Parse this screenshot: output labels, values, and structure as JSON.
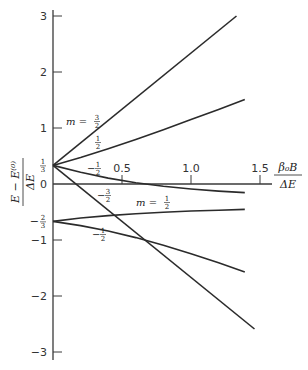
{
  "chart_data": {
    "type": "line",
    "title": "",
    "xlabel": "β₀B / ΔE",
    "ylabel": "(E − E⁽⁰⁾) / ΔE",
    "xlim": [
      0,
      1.6
    ],
    "ylim": [
      -3.2,
      3.1
    ],
    "grid": false,
    "legend": "none (inline annotations)",
    "x_ticks": [
      {
        "value": 0.5,
        "label": "0.5"
      },
      {
        "value": 1.0,
        "label": "1.0"
      },
      {
        "value": 1.5,
        "label": "1.5"
      }
    ],
    "y_ticks": [
      {
        "value": 3,
        "label": "3"
      },
      {
        "value": 2,
        "label": "2"
      },
      {
        "value": 1,
        "label": "1"
      },
      {
        "value": 0,
        "label": "0"
      },
      {
        "value": -1,
        "label": "−1"
      },
      {
        "value": -2,
        "label": "−2"
      },
      {
        "value": -3,
        "label": "−3"
      }
    ],
    "y_special_labels": [
      {
        "value": 0.3333,
        "num": "1",
        "den": "3",
        "sign": ""
      },
      {
        "value": -0.6667,
        "num": "2",
        "den": "3",
        "sign": "−"
      }
    ],
    "series": [
      {
        "name": "m = 3/2",
        "x": [
          0,
          1.33
        ],
        "y": [
          0.333,
          3.0
        ]
      },
      {
        "name": "m = 1/2 (upper)",
        "x": [
          0,
          0.2,
          0.4,
          0.6,
          0.8,
          1.0,
          1.2,
          1.39
        ],
        "y": [
          0.333,
          0.475,
          0.63,
          0.797,
          0.97,
          1.15,
          1.333,
          1.51
        ]
      },
      {
        "name": "m = -1/2 (upper)",
        "x": [
          0,
          0.2,
          0.4,
          0.6,
          0.8,
          1.0,
          1.2,
          1.39
        ],
        "y": [
          0.333,
          0.209,
          0.106,
          0.023,
          -0.041,
          -0.089,
          -0.126,
          -0.154
        ]
      },
      {
        "name": "m = -3/2",
        "x": [
          0,
          1.46
        ],
        "y": [
          0.333,
          -2.59
        ]
      },
      {
        "name": "m = 1/2 (lower)",
        "x": [
          0,
          0.2,
          0.4,
          0.6,
          0.8,
          1.0,
          1.2,
          1.39
        ],
        "y": [
          -0.667,
          -0.608,
          -0.564,
          -0.53,
          -0.504,
          -0.483,
          -0.467,
          -0.454
        ]
      },
      {
        "name": "m = -1/2 (lower)",
        "x": [
          0,
          0.2,
          0.4,
          0.6,
          0.8,
          1.0,
          1.2,
          1.39
        ],
        "y": [
          -0.667,
          -0.743,
          -0.839,
          -0.957,
          -1.093,
          -1.244,
          -1.407,
          -1.57
        ]
      }
    ],
    "annotations": [
      {
        "id": "m32",
        "prefix": "m = ",
        "sign": "",
        "num": "3",
        "den": "2",
        "px": 66,
        "py": 125
      },
      {
        "id": "up12",
        "prefix": "",
        "sign": "",
        "num": "1",
        "den": "2",
        "px": 95,
        "py": 146
      },
      {
        "id": "upm12",
        "prefix": "",
        "sign": "−",
        "num": "1",
        "den": "2",
        "px": 87,
        "py": 172
      },
      {
        "id": "m32neg",
        "prefix": "",
        "sign": "−",
        "num": "3",
        "den": "2",
        "px": 97,
        "py": 199
      },
      {
        "id": "low12",
        "prefix": "m = ",
        "sign": "",
        "num": "1",
        "den": "2",
        "px": 136,
        "py": 206
      },
      {
        "id": "lowm12",
        "prefix": "",
        "sign": "−",
        "num": "1",
        "den": "2",
        "px": 92,
        "py": 238
      }
    ]
  },
  "axes": {
    "x_title_num": "β₀B",
    "x_title_den": "ΔE",
    "y_title_num": "E − E⁽⁰⁾",
    "y_title_den": "ΔE"
  },
  "colors": {
    "line": "#2b2b2b",
    "axis": "#3a3a3a"
  }
}
